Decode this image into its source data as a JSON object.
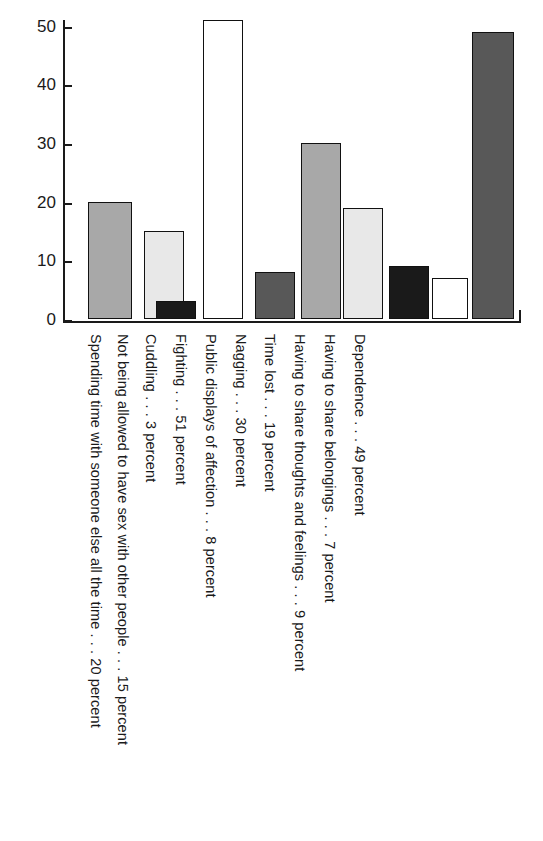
{
  "chart_data": {
    "type": "bar",
    "title": "",
    "subtitle": "",
    "xlabel": "",
    "ylabel": "",
    "ylim": [
      0,
      51
    ],
    "grid": false,
    "legend": null,
    "y_ticks": [
      "0",
      "10",
      "20",
      "30",
      "40",
      "50"
    ],
    "y_tick_values": [
      0,
      10,
      20,
      30,
      40,
      50
    ],
    "categories": [
      "Spending time with someone else all the time . . . 20 percent",
      "Not being allowed to have sex with other people . . . 15 percent",
      "Cuddling . . . 3 percent",
      "Fighting . . . 51 percent",
      "Public displays of affection . . . 8 percent",
      "Nagging . . . 30 percent",
      "Time lost . . . 19 percent",
      "Having to share thoughts and feelings . . . 9 percent",
      "Having to share belongings . . . 7 percent",
      "Dependence . . . 49 percent"
    ],
    "short_names": [
      "Spending time with someone else all the time",
      "Not being allowed to have sex with other people",
      "Cuddling",
      "Fighting",
      "Public displays of affection",
      "Nagging",
      "Time lost",
      "Having to share thoughts and feelings",
      "Having to share belongings",
      "Dependence"
    ],
    "values": [
      20,
      15,
      3,
      51,
      8,
      30,
      19,
      9,
      7,
      49
    ],
    "units": "percent",
    "bar_colors": [
      "#a8a8a8",
      "#e8e8e8",
      "#1a1a1a",
      "#ffffff",
      "#585858",
      "#a8a8a8",
      "#e8e8e8",
      "#1a1a1a",
      "#ffffff",
      "#585858"
    ],
    "bar_outline_color": "#111111",
    "axis_color": "#1a1a1a",
    "background_color": "#ffffff"
  },
  "bars": [
    {
      "label": "Spending time with someone else all the time . . . 20 percent",
      "value": 20,
      "color": "#a8a8a8",
      "x": 88,
      "w": 44
    },
    {
      "label": "Not being allowed to have sex with other people . . . 15 percent",
      "value": 15,
      "color": "#e8e8e8",
      "x": 144,
      "w": 40
    },
    {
      "label": "Cuddling . . . 3 percent",
      "value": 3,
      "color": "#1a1a1a",
      "x": 156,
      "w": 40
    },
    {
      "label": "Fighting . . . 51 percent",
      "value": 51,
      "color": "#ffffff",
      "x": 203,
      "w": 40
    },
    {
      "label": "Public displays of affection . . . 8 percent",
      "value": 8,
      "color": "#585858",
      "x": 255,
      "w": 40
    },
    {
      "label": "Nagging . . . 30 percent",
      "value": 30,
      "color": "#a8a8a8",
      "x": 301,
      "w": 40
    },
    {
      "label": "Time lost . . . 19 percent",
      "value": 19,
      "color": "#e8e8e8",
      "x": 343,
      "w": 40
    },
    {
      "label": "Having to share thoughts and feelings . . . 9 percent",
      "value": 9,
      "color": "#1a1a1a",
      "x": 389,
      "w": 40
    },
    {
      "label": "Having to share belongings . . . 7 percent",
      "value": 7,
      "color": "#ffffff",
      "x": 432,
      "w": 36
    },
    {
      "label": "Dependence . . . 49 percent",
      "value": 49,
      "color": "#585858",
      "x": 472,
      "w": 42
    }
  ],
  "label_positions": [
    {
      "x": 103,
      "text": "Spending time with someone else all the time . . . 20 percent"
    },
    {
      "x": 130,
      "text": "Not being allowed to have sex with other people . . . 15 percent"
    },
    {
      "x": 158,
      "text": "Cuddling . . . 3 percent"
    },
    {
      "x": 188,
      "text": "Fighting . . . 51 percent"
    },
    {
      "x": 218,
      "text": "Public displays of affection . . . 8 percent"
    },
    {
      "x": 248,
      "text": "Nagging . . . 30 percent"
    },
    {
      "x": 277,
      "text": "Time lost . . . 19 percent"
    },
    {
      "x": 307,
      "text": "Having to share thoughts and feelings . . . 9 percent"
    },
    {
      "x": 337,
      "text": "Having to share belongings . . . 7 percent"
    },
    {
      "x": 367,
      "text": "Dependence . . . 49 percent"
    }
  ]
}
